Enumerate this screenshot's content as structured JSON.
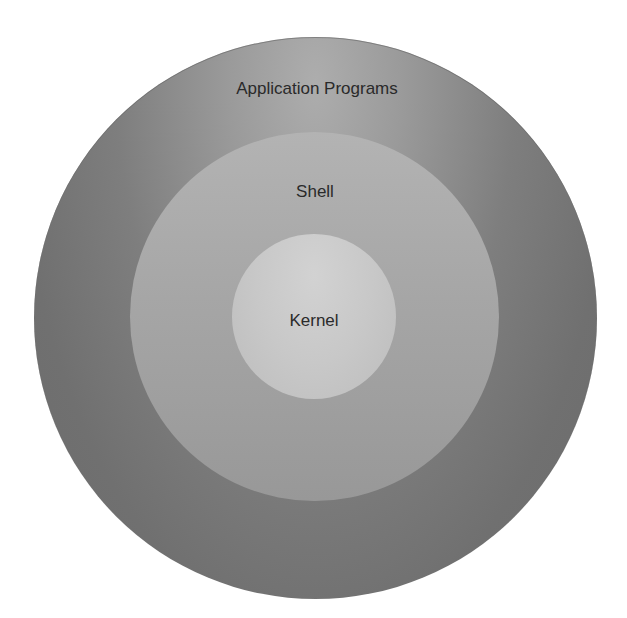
{
  "diagram": {
    "type": "concentric-layers",
    "layers": [
      {
        "label": "Application Programs",
        "role": "outer",
        "color": "#7e7e7e"
      },
      {
        "label": "Shell",
        "role": "middle",
        "color": "#a6a6a6"
      },
      {
        "label": "Kernel",
        "role": "inner",
        "color": "#c8c8c8"
      }
    ]
  }
}
